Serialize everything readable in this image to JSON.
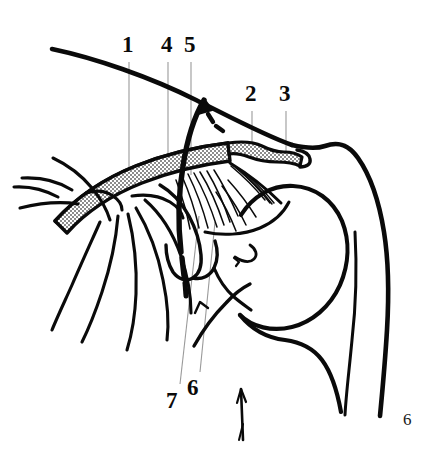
{
  "figure": {
    "kind": "anatomical-line-drawing",
    "width": 425,
    "height": 459,
    "background_color": "#ffffff",
    "ink_color": "#0a0a0a",
    "leader_line_color": "#9a9a9a",
    "fill_texture_color": "#b9b9b9"
  },
  "labels": [
    {
      "id": "1",
      "text": "1",
      "x": 122,
      "y": 33,
      "leader": {
        "x1": 129,
        "y1": 62,
        "x2": 129,
        "y2": 186
      }
    },
    {
      "id": "4",
      "text": "4",
      "x": 161,
      "y": 33,
      "leader": {
        "x1": 168,
        "y1": 62,
        "x2": 168,
        "y2": 160
      }
    },
    {
      "id": "5",
      "text": "5",
      "x": 184,
      "y": 33,
      "leader": {
        "x1": 191,
        "y1": 62,
        "x2": 191,
        "y2": 175
      }
    },
    {
      "id": "2",
      "text": "2",
      "x": 245,
      "y": 82,
      "leader": {
        "x1": 252,
        "y1": 111,
        "x2": 252,
        "y2": 152
      }
    },
    {
      "id": "3",
      "text": "3",
      "x": 279,
      "y": 82,
      "leader": {
        "x1": 286,
        "y1": 111,
        "x2": 286,
        "y2": 158
      }
    },
    {
      "id": "6",
      "text": "6",
      "x": 187,
      "y": 376,
      "leader": {
        "x1": 200,
        "y1": 374,
        "x2": 214,
        "y2": 222
      }
    },
    {
      "id": "7",
      "text": "7",
      "x": 166,
      "y": 389,
      "leader": {
        "x1": 179,
        "y1": 387,
        "x2": 198,
        "y2": 218
      }
    }
  ],
  "corner_label": {
    "text": "6",
    "x": 403,
    "y": 411
  }
}
